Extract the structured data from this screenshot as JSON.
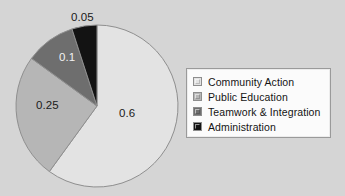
{
  "chart_data": {
    "type": "pie",
    "title": "",
    "subtitle": "",
    "xlabel": "",
    "ylabel": "",
    "grid": false,
    "legend_position": "right",
    "start_angle_deg": 0,
    "direction": "clockwise",
    "categories": [
      "Community Action",
      "Public Education",
      "Teamwork & Integration",
      "Administration"
    ],
    "values": [
      0.6,
      0.25,
      0.1,
      0.05
    ],
    "data_labels": [
      "0.6",
      "0.25",
      "0.1",
      "0.05"
    ],
    "colors": [
      "#e3e3e3",
      "#b6b6b6",
      "#6e6e6e",
      "#131313"
    ],
    "label_text_colors": [
      "#1a1a1a",
      "#1a1a1a",
      "#f2f2f2",
      "#1a1a1a"
    ],
    "slices": [
      {
        "label": "Community Action",
        "value": 0.6,
        "data_label": "0.6",
        "color": "#e3e3e3",
        "sweep_deg": 216
      },
      {
        "label": "Public Education",
        "value": 0.25,
        "data_label": "0.25",
        "color": "#b6b6b6",
        "sweep_deg": 90
      },
      {
        "label": "Teamwork & Integration",
        "value": 0.1,
        "data_label": "0.1",
        "color": "#6e6e6e",
        "sweep_deg": 36
      },
      {
        "label": "Administration",
        "value": 0.05,
        "data_label": "0.05",
        "color": "#131313",
        "sweep_deg": 18
      }
    ]
  },
  "legend": {
    "entries": [
      {
        "label": "Community Action",
        "color": "#e3e3e3"
      },
      {
        "label": "Public Education",
        "color": "#b6b6b6"
      },
      {
        "label": "Teamwork & Integration",
        "color": "#6e6e6e"
      },
      {
        "label": "Administration",
        "color": "#131313"
      }
    ]
  },
  "canvas": {
    "background": "#d5d5d5",
    "pie_outline": "#8f8f8f"
  }
}
